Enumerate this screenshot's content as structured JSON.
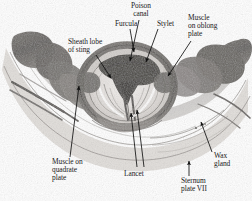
{
  "figure": {
    "kind": "histological-micrograph",
    "background_color": "#ffffff",
    "stain_tone": "#8d8d8d",
    "label_color": "#1a1a1a",
    "leader_color": "#111111"
  },
  "labels": [
    {
      "id": "poison-canal",
      "name": "Poison canal",
      "lines": [
        "Poison",
        "canal"
      ],
      "align": "center",
      "x": 131,
      "y": 2,
      "leader": {
        "x1": 139,
        "y1": 20,
        "x2": 130,
        "y2": 61
      }
    },
    {
      "id": "furcula",
      "name": "Furcula",
      "lines": [
        "Furcula"
      ],
      "align": "center",
      "x": 115,
      "y": 20,
      "leader": {
        "x1": 130,
        "y1": 29,
        "x2": 134,
        "y2": 52
      }
    },
    {
      "id": "stylet",
      "name": "Stylet",
      "lines": [
        "Stylet"
      ],
      "align": "center",
      "x": 157,
      "y": 20,
      "leader": {
        "x1": 158,
        "y1": 29,
        "x2": 146,
        "y2": 62
      }
    },
    {
      "id": "muscle-on-oblong-plate",
      "name": "Muscle on oblong plate",
      "lines": [
        "Muscle",
        "on oblong",
        "plate"
      ],
      "align": "left",
      "x": 188,
      "y": 14,
      "leader": {
        "x1": 191,
        "y1": 41,
        "x2": 168,
        "y2": 76
      }
    },
    {
      "id": "sheath-lobe-of-sting",
      "name": "Sheath lobe of sting",
      "lines": [
        "Sheath lobe",
        "of sting"
      ],
      "align": "left",
      "x": 68,
      "y": 38,
      "leader": {
        "x1": 96,
        "y1": 55,
        "x2": 111,
        "y2": 78
      }
    },
    {
      "id": "muscle-on-quadrate-plate",
      "name": "Muscle on quadrate plate",
      "lines": [
        "Muscle on",
        "quadrate",
        "plate"
      ],
      "align": "left",
      "x": 52,
      "y": 158,
      "leader": {
        "x1": 70,
        "y1": 157,
        "x2": 79,
        "y2": 86
      }
    },
    {
      "id": "lancet",
      "name": "Lancet",
      "lines": [
        "Lancet"
      ],
      "align": "center",
      "x": 124,
      "y": 170,
      "leader": {
        "x1": 137,
        "y1": 167,
        "x2": 131,
        "y2": 113
      },
      "leader2": {
        "x1": 144,
        "y1": 167,
        "x2": 137,
        "y2": 110
      }
    },
    {
      "id": "wax-gland",
      "name": "Wax gland",
      "lines": [
        "Wax",
        "gland"
      ],
      "align": "left",
      "x": 214,
      "y": 152,
      "leader": {
        "x1": 212,
        "y1": 152,
        "x2": 201,
        "y2": 122
      }
    },
    {
      "id": "sternum-plate-vii",
      "name": "Sternum plate VII",
      "lines": [
        "Sternum",
        "plate VII"
      ],
      "align": "left",
      "x": 181,
      "y": 177,
      "leader": {
        "x1": 189,
        "y1": 176,
        "x2": 189,
        "y2": 161
      }
    }
  ]
}
